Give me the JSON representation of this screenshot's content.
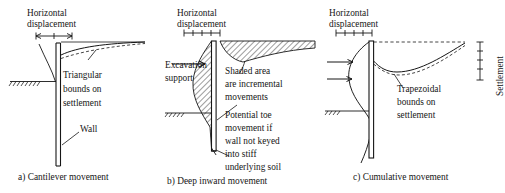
{
  "figure": {
    "background": "#ffffff",
    "ink": "#161616"
  },
  "panels": [
    {
      "id": "a",
      "caption": "a) Cantilever movement",
      "axis_label": "Horizontal\ndisplacement",
      "axis_label_line1": "Horizontal",
      "axis_label_line2": "displacement",
      "dimension_marker": "double-headed-arrow",
      "annotations": [
        {
          "name": "triangular-bounds-label",
          "text": "Triangular\nbounds on\nsettlement",
          "line1": "Triangular",
          "line2": "bounds on",
          "line3": "settlement"
        },
        {
          "name": "wall-label",
          "text": "Wall"
        }
      ],
      "elements": [
        "wall",
        "ground-line",
        "deflected-shape",
        "settlement-curve-solid",
        "settlement-curve-dashed",
        "leader-lines"
      ]
    },
    {
      "id": "b",
      "caption": "b) Deep inward movement",
      "axis_label_line1": "Horizontal",
      "axis_label_line2": "displacement",
      "dimension_marker": "tick-scale",
      "annotations": [
        {
          "name": "excavation-support-label",
          "line1": "Excavation",
          "line2": "support"
        },
        {
          "name": "shaded-area-label",
          "line1": "Shaded area",
          "line2": "are incremental",
          "line3": "movements"
        },
        {
          "name": "potential-toe-label",
          "line1": "Potential toe",
          "line2": "movement if",
          "line3": "wall not keyed",
          "line4": "into stiff",
          "line5": "underlying soil"
        }
      ],
      "elements": [
        "wall",
        "ground-line",
        "hatched-wall-movement",
        "hatched-settlement-trough",
        "arrow-excavation-support",
        "leader-lines"
      ]
    },
    {
      "id": "c",
      "caption": "c) Cumulative movement",
      "axis_label_line1": "Horizontal",
      "axis_label_line2": "displacement",
      "dimension_marker": "tick-scale",
      "annotations": [
        {
          "name": "trapezoidal-bounds-label",
          "line1": "Trapezoidal",
          "line2": "bounds on",
          "line3": "settlement"
        },
        {
          "name": "settlement-axis-label",
          "text": "Settlement"
        }
      ],
      "elements": [
        "wall",
        "ground-line",
        "deflection-profile",
        "inward-arrows",
        "datum-dashed-line",
        "settlement-curve-solid",
        "settlement-curve-dashed",
        "settlement-dimension"
      ]
    }
  ]
}
